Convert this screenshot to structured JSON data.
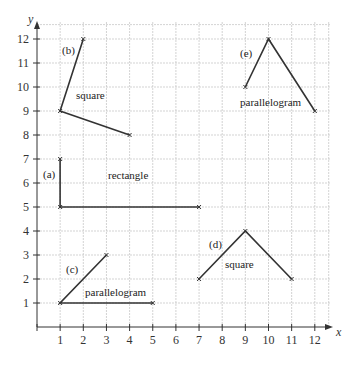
{
  "diagram": {
    "axes": {
      "x_label": "x",
      "y_label": "y",
      "x_ticks": [
        "1",
        "2",
        "3",
        "4",
        "5",
        "6",
        "7",
        "8",
        "9",
        "10",
        "11",
        "12"
      ],
      "y_ticks": [
        "1",
        "2",
        "3",
        "4",
        "5",
        "6",
        "7",
        "8",
        "9",
        "10",
        "11",
        "12"
      ]
    },
    "shapes": [
      {
        "id": "a",
        "tag": "(a)",
        "name": "rectangle",
        "points": [
          [
            1,
            7
          ],
          [
            1,
            5
          ],
          [
            7,
            5
          ]
        ]
      },
      {
        "id": "b",
        "tag": "(b)",
        "name": "square",
        "points": [
          [
            2,
            12
          ],
          [
            1,
            9
          ],
          [
            4,
            8
          ]
        ]
      },
      {
        "id": "c",
        "tag": "(c)",
        "name": "parallelogram",
        "points": [
          [
            3,
            3
          ],
          [
            1,
            1
          ],
          [
            5,
            1
          ]
        ]
      },
      {
        "id": "d",
        "tag": "(d)",
        "name": "square",
        "points": [
          [
            7,
            2
          ],
          [
            9,
            4
          ],
          [
            11,
            2
          ]
        ]
      },
      {
        "id": "e",
        "tag": "(e)",
        "name": "parallelogram",
        "points": [
          [
            9,
            10
          ],
          [
            10,
            12
          ],
          [
            12,
            9
          ]
        ]
      }
    ],
    "labels": {
      "a_tag": "(a)",
      "a_name": "rectangle",
      "b_tag": "(b)",
      "b_name": "square",
      "c_tag": "(c)",
      "c_name": "parallelogram",
      "d_tag": "(d)",
      "d_name": "square",
      "e_tag": "(e)",
      "e_name": "parallelogram"
    },
    "colors": {
      "line": "#333333",
      "grid": "#c8c8c8"
    }
  }
}
